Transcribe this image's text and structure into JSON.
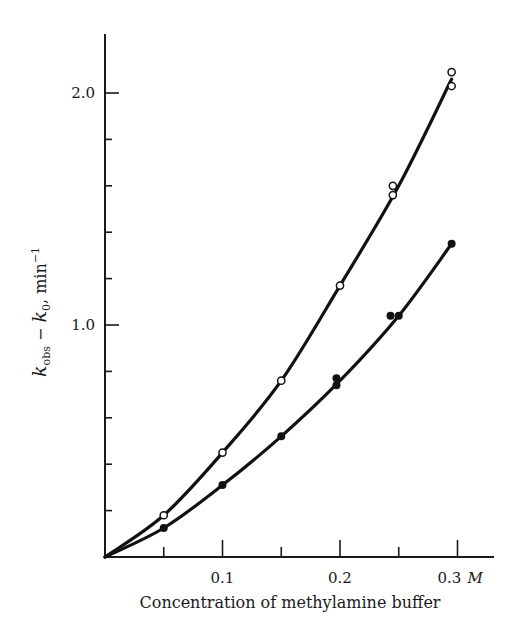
{
  "chart_data": {
    "type": "scatter",
    "title": "",
    "xlabel": "Concentration of methylamine buffer",
    "ylabel": "k_obs − k_0, min⁻¹",
    "ylabel_parts": {
      "k1": "k",
      "sub1": "obs",
      "mid": " − ",
      "k2": "k",
      "sub2": "0",
      "unit": ", min",
      "sup": "−1"
    },
    "xlim": [
      0,
      0.33
    ],
    "ylim": [
      0,
      2.3
    ],
    "x_ticks_major": [
      0.1,
      0.2,
      0.3
    ],
    "x_ticks_minor": [
      0.05,
      0.15,
      0.25
    ],
    "x_tick_labels": [
      "0.1",
      "0.2",
      "0.3"
    ],
    "x_unit_label": "M",
    "y_ticks_major": [
      1.0,
      2.0
    ],
    "y_ticks_minor": [
      0.2,
      0.4,
      0.6,
      0.8,
      1.2,
      1.4,
      1.6,
      1.8
    ],
    "y_tick_labels": [
      "1.0",
      "2.0"
    ],
    "grid": false,
    "legend": null,
    "series": [
      {
        "name": "open circles",
        "marker": "open-circle",
        "points": [
          [
            0.05,
            0.18
          ],
          [
            0.1,
            0.45
          ],
          [
            0.15,
            0.76
          ],
          [
            0.2,
            1.17
          ],
          [
            0.245,
            1.56
          ],
          [
            0.245,
            1.6
          ],
          [
            0.295,
            2.03
          ],
          [
            0.295,
            2.09
          ]
        ],
        "curve": [
          [
            0,
            0
          ],
          [
            0.05,
            0.18
          ],
          [
            0.1,
            0.45
          ],
          [
            0.15,
            0.76
          ],
          [
            0.2,
            1.17
          ],
          [
            0.25,
            1.6
          ],
          [
            0.295,
            2.06
          ]
        ]
      },
      {
        "name": "filled circles",
        "marker": "filled-circle",
        "points": [
          [
            0.05,
            0.125
          ],
          [
            0.1,
            0.31
          ],
          [
            0.15,
            0.52
          ],
          [
            0.197,
            0.74
          ],
          [
            0.197,
            0.77
          ],
          [
            0.243,
            1.04
          ],
          [
            0.25,
            1.04
          ],
          [
            0.295,
            1.35
          ]
        ],
        "curve": [
          [
            0,
            0
          ],
          [
            0.05,
            0.125
          ],
          [
            0.1,
            0.31
          ],
          [
            0.15,
            0.52
          ],
          [
            0.2,
            0.76
          ],
          [
            0.25,
            1.04
          ],
          [
            0.295,
            1.35
          ]
        ]
      }
    ]
  }
}
